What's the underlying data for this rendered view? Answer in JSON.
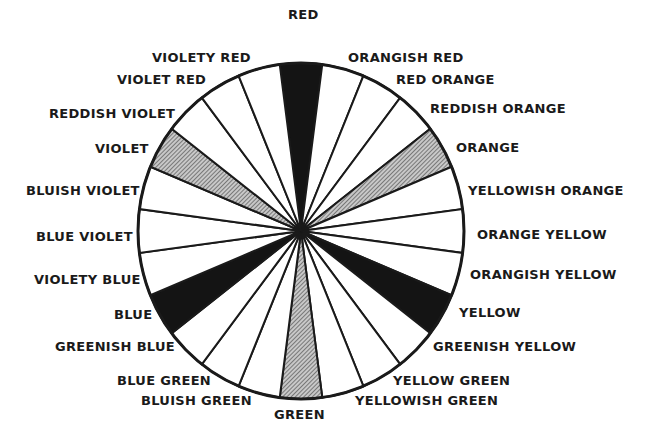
{
  "diagram": {
    "center": {
      "x": 301,
      "y": 231
    },
    "radius": {
      "rx": 163,
      "ry": 168
    },
    "segments": [
      {
        "label": "RED",
        "fill": "black",
        "lx": 288,
        "ly": 7
      },
      {
        "label": "ORANGISH RED",
        "fill": "white",
        "lx": 348,
        "ly": 50
      },
      {
        "label": "RED ORANGE",
        "fill": "white",
        "lx": 396,
        "ly": 72
      },
      {
        "label": "REDDISH ORANGE",
        "fill": "white",
        "lx": 430,
        "ly": 101
      },
      {
        "label": "ORANGE",
        "fill": "gray",
        "lx": 456,
        "ly": 140
      },
      {
        "label": "YELLOWISH ORANGE",
        "fill": "white",
        "lx": 468,
        "ly": 183
      },
      {
        "label": "ORANGE YELLOW",
        "fill": "white",
        "lx": 477,
        "ly": 227
      },
      {
        "label": "ORANGISH YELLOW",
        "fill": "white",
        "lx": 470,
        "ly": 267
      },
      {
        "label": "YELLOW",
        "fill": "black",
        "lx": 459,
        "ly": 305
      },
      {
        "label": "GREENISH YELLOW",
        "fill": "white",
        "lx": 433,
        "ly": 339
      },
      {
        "label": "YELLOW GREEN",
        "fill": "white",
        "lx": 393,
        "ly": 373
      },
      {
        "label": "YELLOWISH GREEN",
        "fill": "white",
        "lx": 355,
        "ly": 393
      },
      {
        "label": "GREEN",
        "fill": "gray",
        "lx": 274,
        "ly": 407
      },
      {
        "label": "BLUISH GREEN",
        "fill": "white",
        "lx": 141,
        "ly": 393
      },
      {
        "label": "BLUE GREEN",
        "fill": "white",
        "lx": 117,
        "ly": 373
      },
      {
        "label": "GREENISH BLUE",
        "fill": "white",
        "lx": 55,
        "ly": 339
      },
      {
        "label": "BLUE",
        "fill": "black",
        "lx": 114,
        "ly": 307
      },
      {
        "label": "VIOLETY BLUE",
        "fill": "white",
        "lx": 34,
        "ly": 272
      },
      {
        "label": "BLUE VIOLET",
        "fill": "white",
        "lx": 36,
        "ly": 229
      },
      {
        "label": "BLUISH VIOLET",
        "fill": "white",
        "lx": 26,
        "ly": 183
      },
      {
        "label": "VIOLET",
        "fill": "gray",
        "lx": 95,
        "ly": 141
      },
      {
        "label": "REDDISH VIOLET",
        "fill": "white",
        "lx": 49,
        "ly": 106
      },
      {
        "label": "VIOLET RED",
        "fill": "white",
        "lx": 117,
        "ly": 72
      },
      {
        "label": "VIOLETY RED",
        "fill": "white",
        "lx": 152,
        "ly": 50
      }
    ],
    "colors": {
      "black": "#141414",
      "gray": "#9a9a9a",
      "white": "#ffffff",
      "stroke": "#1a1a1a"
    }
  }
}
